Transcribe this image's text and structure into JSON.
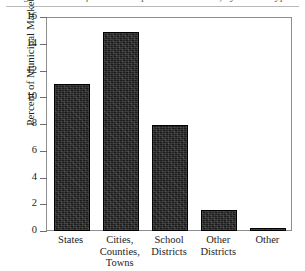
{
  "figure": {
    "title_fragment": "Figure: Share of the Municipal Bond Market, by Issuer Type",
    "y_axis_title": "Percent of Municipal Market"
  },
  "chart_data": {
    "type": "bar",
    "title": "Figure: Share of the Municipal Bond Market, by Issuer Type",
    "xlabel": "",
    "ylabel": "Percent of Municipal Market",
    "ylim": [
      0,
      16
    ],
    "yticks": [
      0,
      2,
      4,
      6,
      8,
      10,
      12,
      14,
      16
    ],
    "ytick_labels": [
      "0",
      "2",
      "4",
      "6",
      "8",
      "10",
      "12",
      "14",
      "16"
    ],
    "grid": false,
    "legend": "none",
    "bar_color": "#1b1b1b",
    "categories": [
      "States",
      "Cities, Counties, Towns",
      "School Districts",
      "Other Districts",
      "Other"
    ],
    "category_lines": [
      [
        "States"
      ],
      [
        "Cities,",
        "Counties,",
        "Towns"
      ],
      [
        "School",
        "Districts"
      ],
      [
        "Other",
        "Districts"
      ],
      [
        "Other"
      ]
    ],
    "values": [
      11.0,
      14.9,
      7.9,
      1.6,
      0.2
    ]
  }
}
